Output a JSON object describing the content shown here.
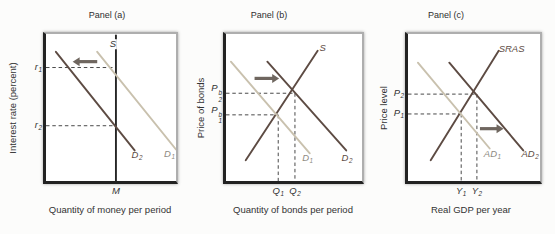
{
  "figure": {
    "colors": {
      "dark": "#5d4b43",
      "tan": "#c9c1ae",
      "black": "#262626",
      "arrow": "#6f665f",
      "dash": "#4a4a4a",
      "text": "#333333",
      "tan_label": "#8e8a82"
    },
    "panels": [
      {
        "title": "Panel (a)",
        "y_axis": "Interest rate (percent)",
        "x_axis": "Quantity of money per period",
        "curves": [
          {
            "name": "money-supply-curve",
            "color": "black",
            "x1": 0.538,
            "y1": 0.01,
            "x2": 0.538,
            "y2": 1.0,
            "label": {
              "base": "S"
            },
            "lx": 0.515,
            "ly": 0.07,
            "label_color": "text",
            "label_bg": true
          },
          {
            "name": "money-demand-curve-d1",
            "color": "tan",
            "x1": 0.394,
            "y1": 0.121,
            "x2": 1.0,
            "y2": 0.785,
            "label": {
              "base": "D",
              "sub": "1"
            },
            "lx": 0.95,
            "ly": 0.825,
            "label_color": "tan_label"
          },
          {
            "name": "money-demand-curve-d2",
            "color": "dark",
            "x1": 0.076,
            "y1": 0.121,
            "x2": 0.682,
            "y2": 0.792,
            "label": {
              "base": "D",
              "sub": "2"
            },
            "lx": 0.7,
            "ly": 0.828,
            "label_color": "dark"
          }
        ],
        "guides": [
          {
            "y": 0.228,
            "x": 0.538,
            "drop": false,
            "label": {
              "base": "r",
              "sub": "1"
            }
          },
          {
            "y": 0.624,
            "x": 0.538,
            "drop": false,
            "label": {
              "base": "r",
              "sub": "2"
            }
          }
        ],
        "ticks": [
          {
            "x": 0.538,
            "label": {
              "base": "M"
            }
          }
        ],
        "arrow": {
          "name": "shift-left-arrow",
          "y": 0.188,
          "x1": 0.394,
          "x2": 0.205
        }
      },
      {
        "title": "Panel (b)",
        "y_axis": "Price of bonds",
        "x_axis": "Quantity of bonds per period",
        "curves": [
          {
            "name": "bond-supply-curve",
            "color": "dark",
            "x1": 0.145,
            "y1": 0.859,
            "x2": 0.674,
            "y2": 0.114,
            "label": {
              "base": "S"
            },
            "lx": 0.71,
            "ly": 0.095,
            "label_color": "dark"
          },
          {
            "name": "bond-demand-curve-d1",
            "color": "tan",
            "x1": 0.036,
            "y1": 0.188,
            "x2": 0.616,
            "y2": 0.812,
            "label": {
              "base": "D",
              "sub": "1"
            },
            "lx": 0.6,
            "ly": 0.85,
            "label_color": "tan_label"
          },
          {
            "name": "bond-demand-curve-d2",
            "color": "dark",
            "x1": 0.304,
            "y1": 0.188,
            "x2": 0.884,
            "y2": 0.792,
            "label": {
              "base": "D",
              "sub": "2"
            },
            "lx": 0.89,
            "ly": 0.85,
            "label_color": "dark"
          }
        ],
        "guides": [
          {
            "y": 0.403,
            "x": 0.507,
            "drop": true,
            "label": {
              "base": "P",
              "sup": "b",
              "sub": "2"
            }
          },
          {
            "y": 0.55,
            "x": 0.384,
            "drop": true,
            "label": {
              "base": "P",
              "sup": "b",
              "sub": "1"
            }
          }
        ],
        "ticks": [
          {
            "x": 0.384,
            "label": {
              "base": "Q",
              "sub": "1"
            }
          },
          {
            "x": 0.507,
            "label": {
              "base": "Q",
              "sub": "2"
            }
          }
        ],
        "arrow": {
          "name": "shift-right-arrow",
          "y": 0.302,
          "x1": 0.21,
          "x2": 0.391
        }
      },
      {
        "title": "Panel (c)",
        "y_axis": "Price level",
        "x_axis": "Real GDP per year",
        "curves": [
          {
            "name": "sras-curve",
            "color": "dark",
            "x1": 0.172,
            "y1": 0.859,
            "x2": 0.687,
            "y2": 0.114,
            "label": {
              "base": "SRAS"
            },
            "lx": 0.785,
            "ly": 0.105,
            "label_color": "dark"
          },
          {
            "name": "ad1-curve",
            "color": "tan",
            "x1": 0.075,
            "y1": 0.195,
            "x2": 0.619,
            "y2": 0.779,
            "label": {
              "base": "AD",
              "sub": "1"
            },
            "lx": 0.64,
            "ly": 0.825,
            "label_color": "tan_label"
          },
          {
            "name": "ad2-curve",
            "color": "dark",
            "x1": 0.313,
            "y1": 0.195,
            "x2": 0.873,
            "y2": 0.792,
            "label": {
              "base": "AD",
              "sub": "2"
            },
            "lx": 0.925,
            "ly": 0.825,
            "label_color": "dark"
          }
        ],
        "guides": [
          {
            "y": 0.409,
            "x": 0.522,
            "drop": true,
            "label": {
              "base": "P",
              "sub": "2"
            }
          },
          {
            "y": 0.544,
            "x": 0.403,
            "drop": true,
            "label": {
              "base": "P",
              "sub": "1"
            }
          }
        ],
        "ticks": [
          {
            "x": 0.403,
            "label": {
              "base": "Y",
              "sub": "1"
            }
          },
          {
            "x": 0.522,
            "label": {
              "base": "Y",
              "sub": "2"
            }
          }
        ],
        "arrow": {
          "name": "shift-right-arrow",
          "y": 0.644,
          "x1": 0.545,
          "x2": 0.724
        }
      }
    ]
  }
}
